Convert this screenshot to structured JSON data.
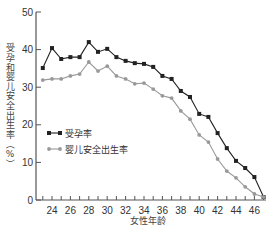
{
  "chart_data": {
    "type": "line",
    "title": "",
    "xlabel": "女性年龄",
    "ylabel": "受孕和婴儿安全出生率（%）",
    "xlim": [
      22,
      47
    ],
    "ylim": [
      0,
      50
    ],
    "xticks": [
      24,
      26,
      28,
      30,
      32,
      34,
      36,
      38,
      40,
      42,
      44,
      46
    ],
    "yticks": [
      0,
      10,
      20,
      30,
      40,
      50
    ],
    "grid": false,
    "legend_position": "inside-left-middle",
    "x": [
      23,
      24,
      25,
      26,
      27,
      28,
      29,
      30,
      31,
      32,
      33,
      34,
      35,
      36,
      37,
      38,
      39,
      40,
      41,
      42,
      43,
      44,
      45,
      46,
      47
    ],
    "series": [
      {
        "name": "受孕率",
        "color": "#222222",
        "marker": "square",
        "values": [
          35.1,
          40.4,
          37.5,
          38.0,
          38.0,
          42.0,
          39.4,
          40.2,
          38.0,
          37.0,
          36.4,
          36.2,
          35.4,
          33.0,
          32.2,
          29.0,
          27.4,
          22.9,
          22.1,
          17.8,
          13.8,
          10.4,
          8.5,
          6.1,
          0.8
        ]
      },
      {
        "name": "婴儿安全出生率",
        "color": "#999999",
        "marker": "circle",
        "values": [
          31.9,
          32.2,
          32.2,
          33.0,
          33.5,
          36.7,
          34.3,
          35.6,
          33.0,
          32.2,
          30.9,
          31.1,
          29.5,
          27.7,
          27.1,
          23.7,
          21.5,
          17.3,
          15.4,
          10.9,
          7.7,
          5.9,
          3.5,
          1.6,
          0.8
        ]
      }
    ]
  }
}
